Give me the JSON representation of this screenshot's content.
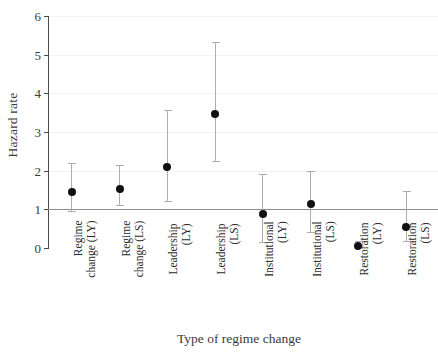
{
  "chart_data": {
    "type": "scatter",
    "title": "",
    "xlabel": "Type of regime change",
    "ylabel": "Hazard rate",
    "ylim": [
      0,
      6
    ],
    "yticks": [
      0,
      1,
      2,
      3,
      4,
      5,
      6
    ],
    "ytick_labels": [
      "0",
      "1",
      "2",
      "3",
      "4",
      "5",
      "6"
    ],
    "grid": true,
    "legend": "none",
    "reference_line": {
      "y": 1,
      "color": "#8d8d8d",
      "label": ""
    },
    "marker": {
      "shape": "circle",
      "color": "#111111",
      "errorbar_color": "#adadad",
      "errorbar_caps": true
    },
    "categories": [
      "Regime change (LY)",
      "Regime change (LS)",
      "Leadership (LY)",
      "Leadership (LS)",
      "Institutional (LY)",
      "Institutional (LS)",
      "Restoration (LY)",
      "Restoration (LS)"
    ],
    "category_lines": [
      [
        "Regime",
        "change (LY)"
      ],
      [
        "Regime",
        "change (LS)"
      ],
      [
        "Leadership",
        "(LY)"
      ],
      [
        "Leadership",
        "(LS)"
      ],
      [
        "Institutional",
        "(LY)"
      ],
      [
        "Institutional",
        "(LS)"
      ],
      [
        "Restoration",
        "(LY)"
      ],
      [
        "Restoration",
        "(LS)"
      ]
    ],
    "values": [
      1.45,
      1.53,
      2.1,
      3.47,
      0.88,
      1.15,
      0.05,
      0.55
    ],
    "ci_lower": [
      0.95,
      1.1,
      1.22,
      2.26,
      0.16,
      0.42,
      0.02,
      0.18
    ],
    "ci_upper": [
      2.2,
      2.14,
      3.58,
      5.33,
      1.92,
      1.98,
      0.18,
      1.48
    ],
    "series": [
      {
        "name": "Hazard rate",
        "values": [
          1.45,
          1.53,
          2.1,
          3.47,
          0.88,
          1.15,
          0.05,
          0.55
        ],
        "ci_lower": [
          0.95,
          1.1,
          1.22,
          2.26,
          0.16,
          0.42,
          0.02,
          0.18
        ],
        "ci_upper": [
          2.2,
          2.14,
          3.58,
          5.33,
          1.92,
          1.98,
          0.18,
          1.48
        ]
      }
    ]
  }
}
